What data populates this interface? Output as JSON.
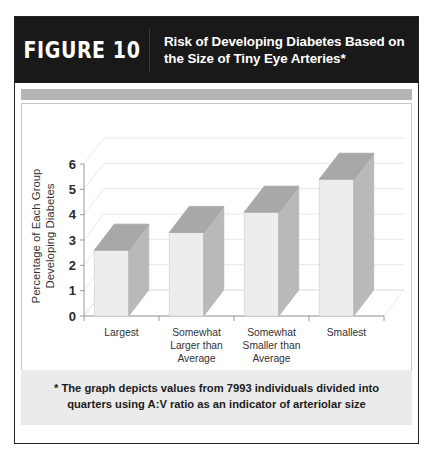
{
  "figure": {
    "number_label": "FIGURE 10",
    "title": "Risk of Developing Diabetes Based on the Size of Tiny Eye Arteries*",
    "footnote": "* The graph depicts values from 7993 individuals divided into quarters using A:V ratio as an indicator of arteriolar size"
  },
  "colors": {
    "header_background": "#191919",
    "header_text": "#ffffff",
    "band": "#b5b5b5",
    "footnote_background": "#ebebeb",
    "bar_front": "#ededed",
    "bar_side": "#b9b9b9",
    "bar_top": "#a8a8a8",
    "gridline": "#e2e2e2",
    "axis": "#9a9a9a",
    "frame": "#222222"
  },
  "chart_data": {
    "type": "bar",
    "title": "Risk of Developing Diabetes Based on the Size of Tiny Eye Arteries*",
    "xlabel": "Size of Eye Arteries",
    "ylabel": "Percentage of Each Group Developing Diabetes",
    "ylabel_lines": [
      "Percentage of Each Group",
      "Developing Diabetes"
    ],
    "categories": [
      "Largest",
      "Somewhat Larger than Average",
      "Somewhat Smaller than Average",
      "Smallest"
    ],
    "category_lines": [
      [
        "Largest"
      ],
      [
        "Somewhat",
        "Larger than",
        "Average"
      ],
      [
        "Somewhat",
        "Smaller than",
        "Average"
      ],
      [
        "Smallest"
      ]
    ],
    "values": [
      2.6,
      3.3,
      4.1,
      5.4
    ],
    "ylim": [
      0,
      6
    ],
    "yticks": [
      0,
      1,
      2,
      3,
      4,
      5,
      6
    ],
    "ytick_labels": [
      "0",
      "1",
      "2",
      "3",
      "4",
      "5",
      "6"
    ],
    "grid": true,
    "legend": false,
    "three_d": true
  }
}
